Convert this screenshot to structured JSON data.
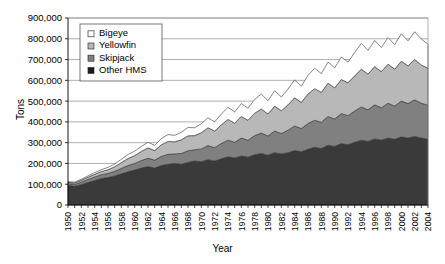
{
  "chart_data": {
    "type": "area",
    "stacked": true,
    "title": "",
    "xlabel": "Year",
    "ylabel": "Tons",
    "xlim": [
      1950,
      2004
    ],
    "ylim": [
      0,
      900000
    ],
    "ytick_step": 100000,
    "ytick_labels": [
      "0",
      "100,000",
      "200,000",
      "300,000",
      "400,000",
      "500,000",
      "600,000",
      "700,000",
      "800,000",
      "900,000"
    ],
    "grid": true,
    "grid_axis": "y",
    "legend_position": "top-left",
    "x": [
      1950,
      1951,
      1952,
      1953,
      1954,
      1955,
      1956,
      1957,
      1958,
      1959,
      1960,
      1961,
      1962,
      1963,
      1964,
      1965,
      1966,
      1967,
      1968,
      1969,
      1970,
      1971,
      1972,
      1973,
      1974,
      1975,
      1976,
      1977,
      1978,
      1979,
      1980,
      1981,
      1982,
      1983,
      1984,
      1985,
      1986,
      1987,
      1988,
      1989,
      1990,
      1991,
      1992,
      1993,
      1994,
      1995,
      1996,
      1997,
      1998,
      1999,
      2000,
      2001,
      2002,
      2003,
      2004
    ],
    "xtick_labels": [
      "1950",
      "1952",
      "1954",
      "1956",
      "1958",
      "1960",
      "1962",
      "1964",
      "1966",
      "1968",
      "1970",
      "1972",
      "1974",
      "1976",
      "1978",
      "1980",
      "1982",
      "1984",
      "1986",
      "1988",
      "1990",
      "1992",
      "1994",
      "1996",
      "1998",
      "2000",
      "2002",
      "2004"
    ],
    "series": [
      {
        "name": "Other HMS",
        "color": "#3a3a3a",
        "order": 1,
        "values": [
          95000,
          90000,
          98000,
          108000,
          118000,
          128000,
          132000,
          140000,
          150000,
          160000,
          168000,
          178000,
          185000,
          178000,
          190000,
          196000,
          200000,
          196000,
          205000,
          212000,
          208000,
          218000,
          212000,
          222000,
          232000,
          226000,
          236000,
          230000,
          242000,
          248000,
          240000,
          252000,
          246000,
          252000,
          262000,
          256000,
          268000,
          278000,
          272000,
          288000,
          282000,
          296000,
          290000,
          302000,
          312000,
          306000,
          318000,
          312000,
          322000,
          316000,
          328000,
          322000,
          330000,
          322000,
          316000
        ]
      },
      {
        "name": "Skipjack",
        "color": "#808080",
        "order": 2,
        "values": [
          8000,
          9000,
          12000,
          15000,
          17000,
          18000,
          20000,
          22000,
          26000,
          30000,
          32000,
          36000,
          40000,
          38000,
          44000,
          48000,
          46000,
          52000,
          56000,
          54000,
          62000,
          68000,
          64000,
          74000,
          80000,
          76000,
          86000,
          82000,
          92000,
          98000,
          92000,
          104000,
          98000,
          108000,
          118000,
          112000,
          124000,
          130000,
          126000,
          138000,
          132000,
          144000,
          140000,
          150000,
          160000,
          152000,
          164000,
          156000,
          168000,
          160000,
          172000,
          166000,
          176000,
          168000,
          164000
        ]
      },
      {
        "name": "Yellowfin",
        "color": "#b8b8b8",
        "order": 3,
        "values": [
          6000,
          7000,
          9000,
          11000,
          13000,
          15000,
          18000,
          22000,
          28000,
          34000,
          38000,
          44000,
          50000,
          46000,
          56000,
          62000,
          58000,
          66000,
          72000,
          68000,
          78000,
          86000,
          80000,
          90000,
          100000,
          92000,
          104000,
          96000,
          108000,
          116000,
          106000,
          120000,
          110000,
          122000,
          136000,
          126000,
          142000,
          152000,
          144000,
          160000,
          150000,
          164000,
          158000,
          170000,
          182000,
          172000,
          184000,
          174000,
          188000,
          178000,
          192000,
          182000,
          194000,
          184000,
          178000
        ]
      },
      {
        "name": "Bigeye",
        "color": "#ffffff",
        "order": 4,
        "values": [
          3000,
          4000,
          5000,
          6000,
          8000,
          9000,
          11000,
          13000,
          16000,
          19000,
          21000,
          24000,
          27000,
          25000,
          30000,
          33000,
          31000,
          36000,
          40000,
          38000,
          43000,
          48000,
          44000,
          52000,
          58000,
          54000,
          62000,
          58000,
          66000,
          72000,
          64000,
          74000,
          66000,
          76000,
          86000,
          78000,
          90000,
          98000,
          90000,
          102000,
          96000,
          108000,
          100000,
          112000,
          124000,
          114000,
          126000,
          116000,
          128000,
          118000,
          132000,
          120000,
          134000,
          124000,
          116000
        ]
      }
    ]
  },
  "legend": {
    "items": [
      {
        "label": "Bigeye",
        "swatch": "#ffffff"
      },
      {
        "label": "Yellowfin",
        "swatch": "#b8b8b8"
      },
      {
        "label": "Skipjack",
        "swatch": "#808080"
      },
      {
        "label": "Other HMS",
        "swatch": "#1a1a1a"
      }
    ]
  }
}
